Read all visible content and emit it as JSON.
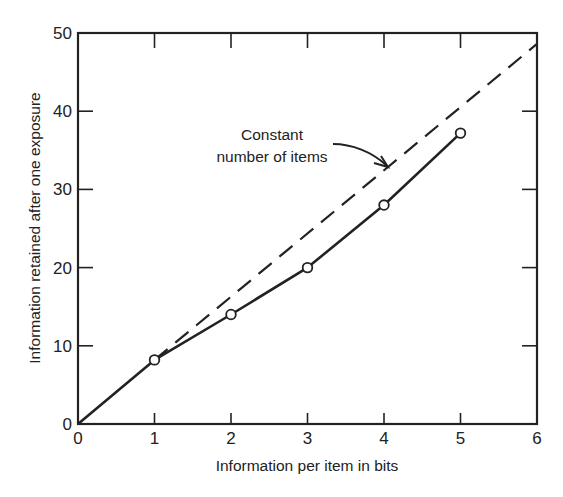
{
  "chart_data": {
    "type": "line",
    "title": "",
    "xlabel": "Information per item in bits",
    "ylabel": "Information retained after one exposure",
    "xlim": [
      0,
      6
    ],
    "ylim": [
      0,
      50
    ],
    "x_ticks": [
      0,
      1,
      2,
      3,
      4,
      5,
      6
    ],
    "y_ticks": [
      0,
      10,
      20,
      30,
      40,
      50
    ],
    "grid": false,
    "legend": null,
    "series": [
      {
        "name": "Observed",
        "style": "solid",
        "marker": "open-circle",
        "x": [
          0,
          1,
          2,
          3,
          4,
          5
        ],
        "y": [
          0,
          8.2,
          14,
          20,
          28,
          37.2
        ],
        "markers_at": [
          1,
          2,
          3,
          4,
          5
        ]
      },
      {
        "name": "Constant number of items",
        "style": "dashed",
        "marker": "none",
        "x": [
          1,
          6
        ],
        "y": [
          8.2,
          48.6
        ]
      }
    ],
    "annotations": [
      {
        "text_lines": [
          "Constant",
          "number of items"
        ],
        "points_to": "dashed line near x=4.0"
      }
    ]
  },
  "colors": {
    "ink": "#222222",
    "background": "#ffffff"
  }
}
